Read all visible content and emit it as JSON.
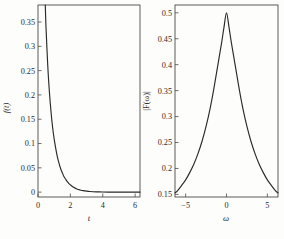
{
  "figure": {
    "title": "",
    "panel_count": 2
  },
  "chart_data": [
    {
      "type": "line",
      "panel": "left",
      "title": "",
      "xlabel": "t",
      "ylabel": "f(t)",
      "xlim": [
        0,
        6.3
      ],
      "ylim": [
        -0.01,
        0.385
      ],
      "grid": false,
      "legend": null,
      "xticks": [
        0,
        2,
        4,
        6
      ],
      "xticklabels": [
        "0",
        "2",
        "4",
        "6"
      ],
      "yticks": [
        0,
        0.05,
        0.1,
        0.15,
        0.2,
        0.25,
        0.3,
        0.35
      ],
      "yticklabels": [
        "0",
        "0.05",
        "0.1",
        "0.15",
        "0.2",
        "0.25",
        "0.3",
        "0.35"
      ],
      "description": "Monotonically decaying exponential-like curve entering at top of frame near t = 0.45 and flattening to zero beyond t = 3.5",
      "x": [
        0.45,
        0.5,
        0.6,
        0.7,
        0.8,
        0.9,
        1.0,
        1.1,
        1.2,
        1.3,
        1.4,
        1.5,
        1.6,
        1.7,
        1.8,
        1.9,
        2.0,
        2.2,
        2.4,
        2.6,
        2.8,
        3.0,
        3.2,
        3.4,
        3.6,
        3.8,
        4.0,
        4.5,
        5.0,
        5.5,
        6.0,
        6.3
      ],
      "y": [
        0.385,
        0.335,
        0.262,
        0.208,
        0.167,
        0.134,
        0.109,
        0.089,
        0.072,
        0.059,
        0.048,
        0.04,
        0.032,
        0.027,
        0.022,
        0.018,
        0.015,
        0.01,
        0.0066,
        0.0045,
        0.003,
        0.002,
        0.0013,
        0.0009,
        0.0006,
        0.0004,
        0.0003,
        0.0001,
        0.0,
        0.0,
        0.0,
        0.0
      ]
    },
    {
      "type": "line",
      "panel": "right",
      "title": "",
      "xlabel": "ω",
      "ylabel": "|F(ω)|",
      "xlim": [
        -6.3,
        6.3
      ],
      "ylim": [
        0.145,
        0.515
      ],
      "grid": false,
      "legend": null,
      "xticks": [
        -5,
        0,
        5
      ],
      "xticklabels": [
        "−5",
        "0",
        "5"
      ],
      "yticks": [
        0.15,
        0.2,
        0.25,
        0.3,
        0.35,
        0.4,
        0.45,
        0.5
      ],
      "yticklabels": [
        "0.15",
        "0.2",
        "0.25",
        "0.3",
        "0.35",
        "0.4",
        "0.45",
        "0.5"
      ],
      "description": "Symmetric single-peaked Lorentzian-like spectrum, maximum 0.5 at ω = 0, decaying to about 0.155 at the frame edges",
      "x": [
        -6.3,
        -6.0,
        -5.5,
        -5.0,
        -4.5,
        -4.0,
        -3.5,
        -3.0,
        -2.5,
        -2.0,
        -1.6,
        -1.2,
        -0.9,
        -0.6,
        -0.3,
        0.0,
        0.3,
        0.6,
        0.9,
        1.2,
        1.6,
        2.0,
        2.5,
        3.0,
        3.5,
        4.0,
        4.5,
        5.0,
        5.5,
        6.0,
        6.3
      ],
      "y": [
        0.153,
        0.157,
        0.167,
        0.178,
        0.192,
        0.208,
        0.228,
        0.252,
        0.281,
        0.316,
        0.349,
        0.386,
        0.414,
        0.442,
        0.473,
        0.5,
        0.473,
        0.442,
        0.414,
        0.386,
        0.349,
        0.316,
        0.281,
        0.252,
        0.228,
        0.208,
        0.192,
        0.178,
        0.167,
        0.157,
        0.153
      ]
    }
  ],
  "colors": {
    "curve": "#2a2a2a",
    "axis": "#4a4a4a",
    "text": "#2b2b2b",
    "background": "#fdfdfb"
  }
}
